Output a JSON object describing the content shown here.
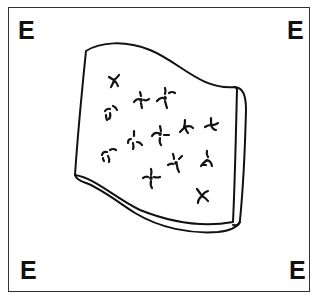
{
  "figure": {
    "corner_labels": {
      "top_left": "E",
      "top_right": "E",
      "bottom_left": "E",
      "bottom_right": "E"
    },
    "colors": {
      "ink": "#111111",
      "frame": "#333333",
      "background": "#ffffff"
    },
    "sheet": {
      "description": "wavy sheet with visible thickness on right and bottom edges",
      "mark_count": 14
    }
  }
}
